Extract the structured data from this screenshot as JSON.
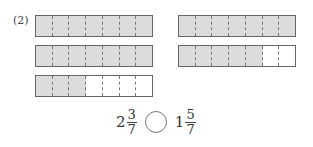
{
  "problem_label": "(2)",
  "unit_parts": 7,
  "bars": [
    {
      "id": "left-1",
      "shaded": 7,
      "total": 7
    },
    {
      "id": "left-2",
      "shaded": 7,
      "total": 7
    },
    {
      "id": "left-3",
      "shaded": 3,
      "total": 7
    },
    {
      "id": "right-1",
      "shaded": 7,
      "total": 7
    },
    {
      "id": "right-2",
      "shaded": 5,
      "total": 7
    }
  ],
  "comparison": {
    "left": {
      "whole": "2",
      "numerator": "3",
      "denominator": "7"
    },
    "right": {
      "whole": "1",
      "numerator": "5",
      "denominator": "7"
    },
    "operator_blank": ""
  },
  "colors": {
    "shaded": "#dcdcdc",
    "border": "#666666"
  }
}
